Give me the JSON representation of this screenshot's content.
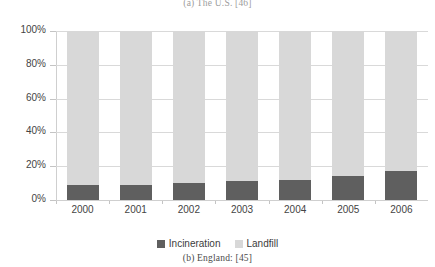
{
  "figure": {
    "caption_top": "(a) The U.S. [46]",
    "caption_bottom": "(b) England: [45]"
  },
  "legend": {
    "position": "bottom-center",
    "items": [
      {
        "label": "Incineration",
        "color": "#5f5f5f"
      },
      {
        "label": "Landfill",
        "color": "#d8d8d8"
      }
    ]
  },
  "axis": {
    "y_ticks": [
      "0%",
      "20%",
      "40%",
      "60%",
      "80%",
      "100%"
    ],
    "x_ticks": [
      "2000",
      "2001",
      "2002",
      "2003",
      "2004",
      "2005",
      "2006"
    ]
  },
  "chart_data": {
    "type": "bar",
    "stacked": true,
    "normalized": true,
    "title": "",
    "subtitle": "",
    "xlabel": "",
    "ylabel": "",
    "ylim": [
      0,
      100
    ],
    "yticks": [
      0,
      20,
      40,
      60,
      80,
      100
    ],
    "ytick_labels": [
      "0%",
      "20%",
      "40%",
      "60%",
      "80%",
      "100%"
    ],
    "grid": "horizontal",
    "legend_position": "bottom-center",
    "categories": [
      "2000",
      "2001",
      "2002",
      "2003",
      "2004",
      "2005",
      "2006"
    ],
    "series": [
      {
        "name": "Incineration",
        "color": "#5f5f5f",
        "values": [
          9,
          9,
          10,
          11,
          12,
          14,
          17
        ]
      },
      {
        "name": "Landfill",
        "color": "#d8d8d8",
        "values": [
          91,
          91,
          90,
          89,
          88,
          86,
          83
        ]
      }
    ],
    "annotations": [
      "(a) The U.S. [46]",
      "(b) England: [45]"
    ]
  }
}
